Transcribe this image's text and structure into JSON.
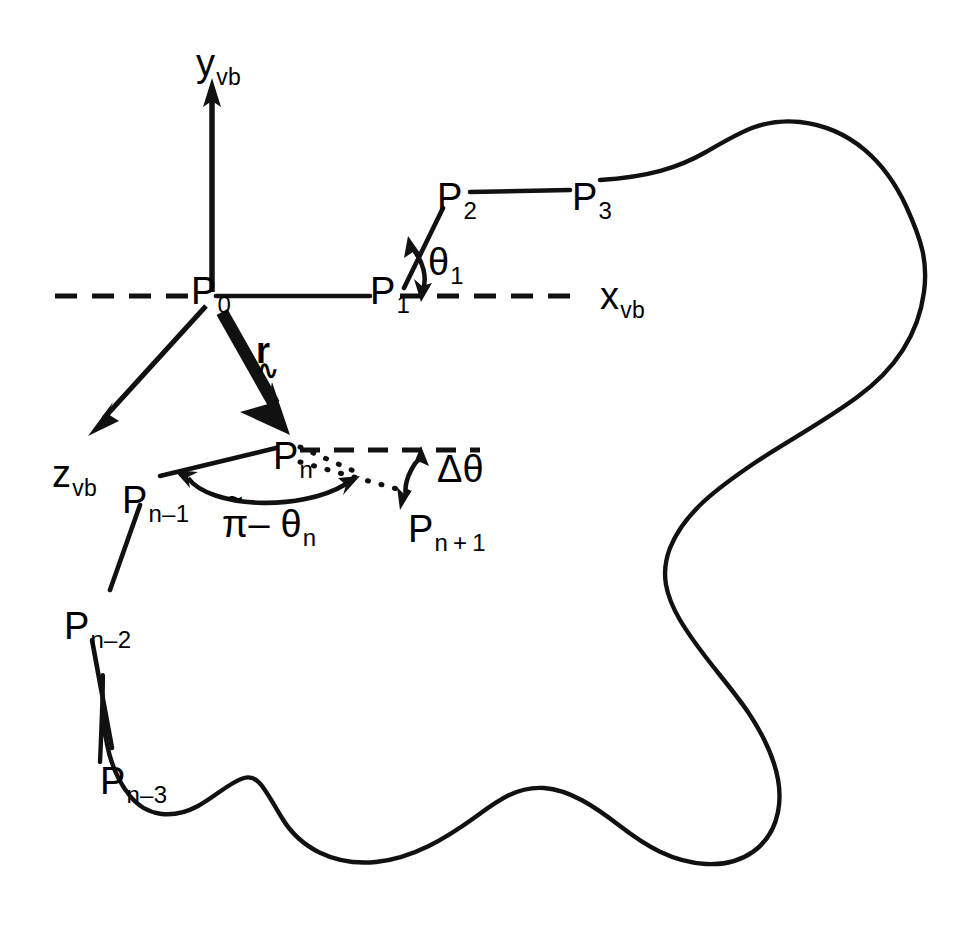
{
  "figure": {
    "stroke_color": "#111111",
    "background_color": "#ffffff"
  },
  "axes": [
    {
      "id": "y-axis",
      "label_base": "y",
      "label_sub": "vb",
      "x": 196,
      "y": 44
    },
    {
      "id": "x-axis",
      "label_base": "x",
      "label_sub": "vb",
      "x": 600,
      "y": 277
    },
    {
      "id": "z-axis",
      "label_base": "z",
      "label_sub": "vb",
      "x": 52,
      "y": 455
    }
  ],
  "vertices": [
    {
      "id": "p0",
      "base": "P",
      "sub": "0",
      "x": 191,
      "y": 272
    },
    {
      "id": "p1",
      "base": "P",
      "sub": "1",
      "x": 370,
      "y": 272
    },
    {
      "id": "p2",
      "base": "P",
      "sub": "2",
      "x": 437,
      "y": 178
    },
    {
      "id": "p3",
      "base": "P",
      "sub": "3",
      "x": 572,
      "y": 178
    },
    {
      "id": "pn",
      "base": "P",
      "sub": "n",
      "x": 273,
      "y": 437
    },
    {
      "id": "pn-minus-1",
      "base": "P",
      "sub": "n–1",
      "x": 122,
      "y": 481
    },
    {
      "id": "pn-minus-2",
      "base": "P",
      "sub": "n–2",
      "x": 64,
      "y": 607
    },
    {
      "id": "pn-minus-3",
      "base": "P",
      "sub": "n–3",
      "x": 100,
      "y": 762
    },
    {
      "id": "pn-plus-1",
      "base": "P",
      "sub": "n + 1",
      "x": 408,
      "y": 510
    }
  ],
  "vector": {
    "id": "r-vector",
    "symbol": "r",
    "tilde": "∿",
    "x": 256,
    "y": 333
  },
  "angles": [
    {
      "id": "theta-1",
      "text": "θ",
      "sub": "1",
      "x": 428,
      "y": 243
    },
    {
      "id": "pi-minus-theta-n",
      "pi": "π",
      "accent": "~",
      "rest": "– θ",
      "sub": "n",
      "x": 222,
      "y": 505
    },
    {
      "id": "delta-theta",
      "text": "Δθ",
      "x": 437,
      "y": 450
    }
  ]
}
